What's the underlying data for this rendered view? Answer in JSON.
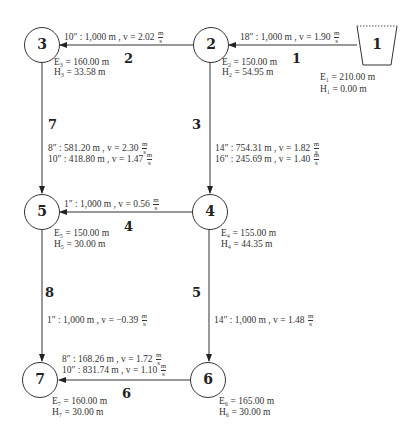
{
  "diagram": {
    "colors": {
      "line": "#333333",
      "background": "#ffffff"
    },
    "nodes": [
      {
        "id": "1",
        "type": "reservoir",
        "E": "E₁ = 210.00 m",
        "H": "H₁ = 0.00 m"
      },
      {
        "id": "2",
        "type": "junction",
        "E": "E₂ = 150.00 m",
        "H": "H₂ = 54.95 m"
      },
      {
        "id": "3",
        "type": "junction",
        "E": "E₃ = 160.00 m",
        "H": "H₃ = 33.58 m"
      },
      {
        "id": "4",
        "type": "junction",
        "E": "E₄ = 155.00 m",
        "H": "H₄ = 44.35 m"
      },
      {
        "id": "5",
        "type": "junction",
        "E": "E₅ = 150.00 m",
        "H": "H₅ = 30.00 m"
      },
      {
        "id": "6",
        "type": "junction",
        "E": "E₆ = 165.00 m",
        "H": "H₆ = 30.00 m"
      },
      {
        "id": "7",
        "type": "junction",
        "E": "E₇ = 160.00 m",
        "H": "H₇ = 30.00 m"
      }
    ],
    "pipes": [
      {
        "id": "1",
        "from": "1",
        "to": "2",
        "segments": [
          {
            "text": "18″ : 1,000 m , v = 1.90"
          }
        ]
      },
      {
        "id": "2",
        "from": "2",
        "to": "3",
        "segments": [
          {
            "text": "10″ : 1,000 m , v = 2.02"
          }
        ]
      },
      {
        "id": "3",
        "from": "2",
        "to": "4",
        "segments": [
          {
            "text": "14″ : 754.31 m , v = 1.82"
          },
          {
            "text": "16″ : 245.69 m , v = 1.40"
          }
        ]
      },
      {
        "id": "4",
        "from": "4",
        "to": "5",
        "segments": [
          {
            "text": "1″ : 1,000 m , v = 0.56"
          }
        ]
      },
      {
        "id": "5",
        "from": "4",
        "to": "6",
        "segments": [
          {
            "text": "14″ : 1,000 m , v = 1.48"
          }
        ]
      },
      {
        "id": "6",
        "from": "6",
        "to": "7",
        "segments": [
          {
            "text": "8″ : 168.26 m , v = 1.72"
          },
          {
            "text": "10″ : 831.74 m , v = 1.10"
          }
        ]
      },
      {
        "id": "7",
        "from": "3",
        "to": "5",
        "segments": [
          {
            "text": "8″ : 581.20 m , v = 2.30"
          },
          {
            "text": "10″ : 418.80 m , v = 1.47"
          }
        ]
      },
      {
        "id": "8",
        "from": "5",
        "to": "7",
        "segments": [
          {
            "text": "1″ : 1,000 m , v = −0.39"
          }
        ]
      }
    ],
    "unit": {
      "num": "m",
      "den": "s"
    }
  }
}
